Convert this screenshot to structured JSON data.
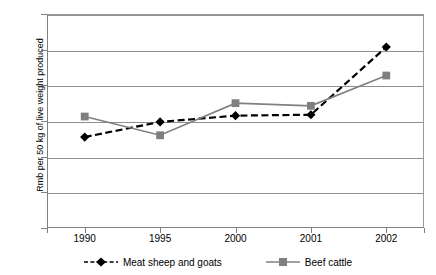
{
  "chart_data": {
    "type": "line",
    "title": "",
    "subtitle": "",
    "xlabel": "",
    "ylabel": "Rmb per 50 kg of live weight produced",
    "categories": [
      "1990",
      "1995",
      "2000",
      "2001",
      "2002"
    ],
    "ylim": [
      0,
      120
    ],
    "yticks": [
      0,
      20,
      40,
      60,
      80,
      100,
      120
    ],
    "ytick_labels": [
      "0",
      "20",
      "40",
      "60",
      "80",
      "100",
      "120"
    ],
    "grid": "horizontal",
    "legend_position": "bottom",
    "series": [
      {
        "name": "Meat sheep and goats",
        "values": [
          51,
          59.5,
          63,
          63.5,
          101.5
        ],
        "color": "#000000",
        "line_style": "dashed",
        "marker": "diamond"
      },
      {
        "name": "Beef cattle",
        "values": [
          62.5,
          52,
          70,
          68.5,
          85.5
        ],
        "color": "#808080",
        "line_style": "solid",
        "marker": "square"
      }
    ]
  },
  "colors": {
    "series_sheep": "#000000",
    "series_beef": "#808080",
    "gridline": "#8f8f8f",
    "axis": "#808080",
    "background": "#ffffff"
  }
}
